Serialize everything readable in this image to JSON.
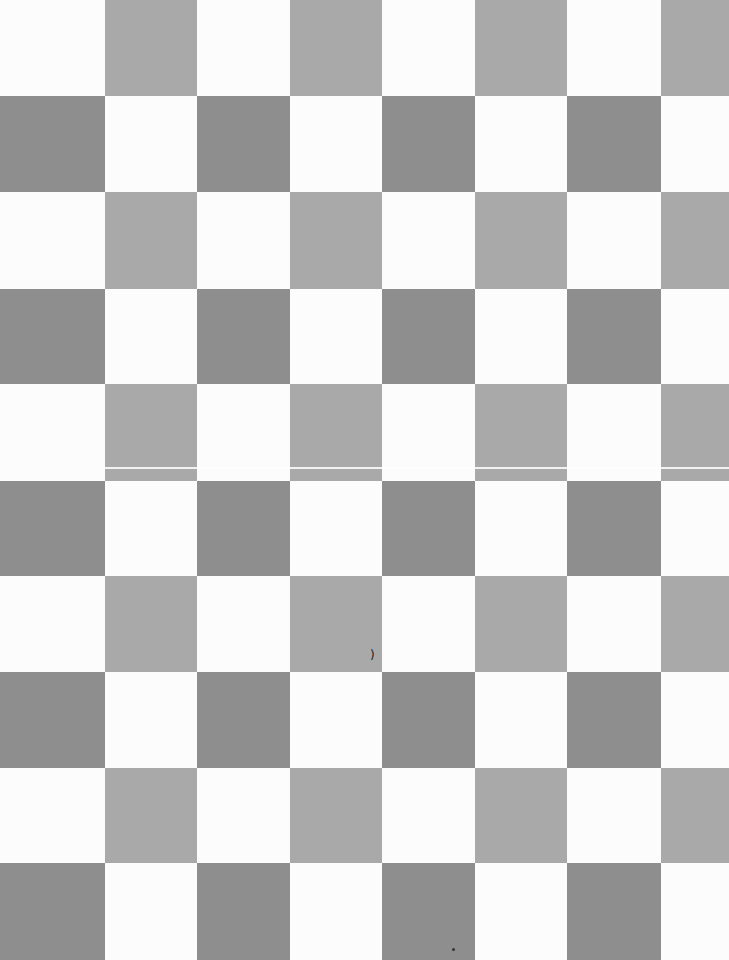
{
  "board": {
    "columns": [
      0,
      105,
      197,
      290,
      382,
      475,
      567,
      661,
      729
    ],
    "rows": [
      0,
      96,
      192,
      289,
      384,
      481,
      576,
      672,
      768,
      863,
      960
    ],
    "colors": {
      "white": "#fcfcfc",
      "light_gray": "#a9a9a9",
      "dark_gray": "#8e8e8e"
    },
    "pattern": "checkerboard"
  },
  "artifacts": {
    "scanline_y": 467,
    "mark": {
      "glyph": ")",
      "x": 370,
      "y": 649
    },
    "dot": {
      "x": 452,
      "y": 948
    }
  }
}
